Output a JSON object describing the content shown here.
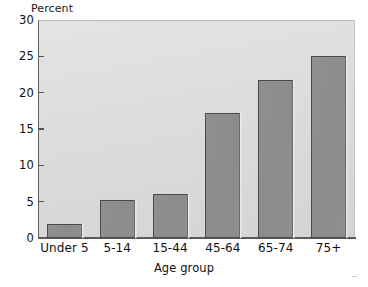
{
  "chart_data": {
    "type": "bar",
    "title": "",
    "xlabel": "Age group",
    "ylabel": "Percent",
    "categories": [
      "Under 5",
      "5-14",
      "15-44",
      "45-64",
      "65-74",
      "75+"
    ],
    "values": [
      1.9,
      5.3,
      6.0,
      17.2,
      21.7,
      25.0
    ],
    "ylim": [
      0,
      30
    ],
    "ytick_labels": [
      "0",
      "5",
      "10",
      "15",
      "20",
      "25",
      "30"
    ],
    "ytick_values": [
      0,
      5,
      10,
      15,
      20,
      25,
      30
    ],
    "grid": false,
    "legend": false,
    "colors": {
      "bar_fill": "#8b8b8b",
      "bar_edge": "#4a4a4a",
      "plot_background": "#dcdcdc",
      "axis": "#555555",
      "text": "#111111",
      "figure_background": "#ffffff"
    }
  }
}
